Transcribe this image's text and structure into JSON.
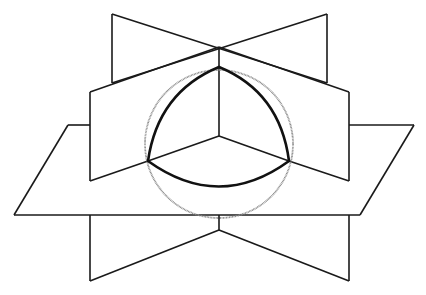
{
  "figure": {
    "colors": {
      "stroke": "#1a1a1a",
      "sphere": "#8a8a8a",
      "background": "#ffffff"
    },
    "sphere": {
      "cx": 219,
      "cy": 144,
      "r": 74
    },
    "center_point": {
      "x": 219,
      "y": 136
    },
    "spherical_triangle_vertices": [
      {
        "x": 219,
        "y": 67
      },
      {
        "x": 148,
        "y": 161
      },
      {
        "x": 289,
        "y": 161
      }
    ]
  },
  "caption": {
    "text": "",
    "note": "caption cut off at bottom edge; illegible"
  }
}
